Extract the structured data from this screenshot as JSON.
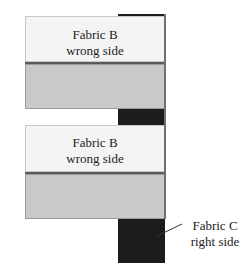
{
  "diagram": {
    "top_unit": {
      "fabric_label_line1": "Fabric B",
      "fabric_label_line2": "wrong side"
    },
    "bottom_unit": {
      "fabric_label_line1": "Fabric B",
      "fabric_label_line2": "wrong side"
    },
    "callout": {
      "line1": "Fabric C",
      "line2": "right side"
    },
    "colors": {
      "fabric_b_wrong": "#f4f4f4",
      "fabric_gray": "#c9c9c9",
      "fabric_c": "#1c1c1c"
    }
  }
}
